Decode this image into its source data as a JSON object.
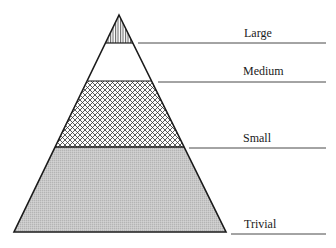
{
  "diagram": {
    "type": "pyramid",
    "levels": [
      {
        "name": "Large",
        "fill": "vertical-hatch"
      },
      {
        "name": "Medium",
        "fill": "white"
      },
      {
        "name": "Small",
        "fill": "crosshatch"
      },
      {
        "name": "Trivial",
        "fill": "gray-stipple"
      }
    ]
  },
  "labels": {
    "large": "Large",
    "medium": "Medium",
    "small": "Small",
    "trivial": "Trivial"
  },
  "colors": {
    "outline": "#1a1a1a",
    "trivial_fill": "#c4c4c4",
    "background": "#ffffff"
  }
}
